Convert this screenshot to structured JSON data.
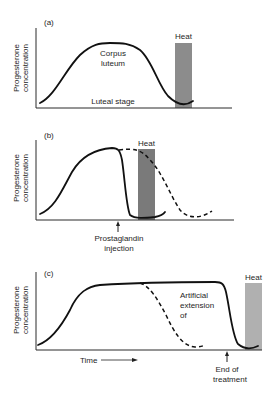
{
  "figure": {
    "panels": [
      {
        "id": "a",
        "label": "(a)",
        "ylabel_line1": "Progesterone",
        "ylabel_line2": "concentration",
        "heat_label": "Heat",
        "annotations": {
          "corpus_1": "Corpus",
          "corpus_2": "luteum",
          "stage": "Luteal stage"
        }
      },
      {
        "id": "b",
        "label": "(b)",
        "ylabel_line1": "Progesterone",
        "ylabel_line2": "concentration",
        "heat_label": "Heat",
        "annotations": {
          "arrow_1": "Prostaglandin",
          "arrow_2": "injection"
        }
      },
      {
        "id": "c",
        "label": "(c)",
        "ylabel_line1": "Progesterone",
        "ylabel_line2": "concentration",
        "heat_label": "Heat",
        "xlabel": "Time",
        "annotations": {
          "ext_1": "Artificial",
          "ext_2": "extension",
          "ext_3": "of",
          "arrow_1": "End of",
          "arrow_2": "treatment"
        }
      }
    ],
    "colors": {
      "heat_bar_a": "#8c8c8c",
      "heat_bar_b": "#7a7a7a",
      "heat_bar_c": "#b0b0b0",
      "line": "#111111"
    }
  }
}
